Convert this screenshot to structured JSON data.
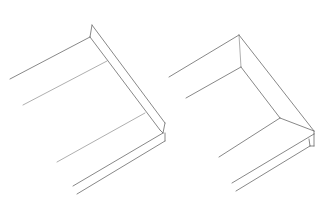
{
  "diagram": {
    "background": "#ffffff",
    "line_color": "#6a6a6a",
    "light_line_color": "#9a9a9a",
    "figures": [
      {
        "name": "left-trim-profile",
        "lines": [
          {
            "x1": 10,
            "y1": 79,
            "x2": 90,
            "y2": 37,
            "tone": "dark"
          },
          {
            "x1": 23,
            "y1": 105,
            "x2": 107,
            "y2": 61,
            "tone": "light"
          },
          {
            "x1": 90,
            "y1": 37,
            "x2": 92,
            "y2": 25,
            "tone": "dark"
          },
          {
            "x1": 92,
            "y1": 25,
            "x2": 165,
            "y2": 123,
            "tone": "dark"
          },
          {
            "x1": 90,
            "y1": 37,
            "x2": 160,
            "y2": 130,
            "tone": "dark"
          },
          {
            "x1": 57,
            "y1": 162,
            "x2": 145,
            "y2": 113,
            "tone": "light"
          },
          {
            "x1": 165,
            "y1": 123,
            "x2": 163,
            "y2": 133,
            "tone": "dark"
          },
          {
            "x1": 160,
            "y1": 130,
            "x2": 163,
            "y2": 133,
            "tone": "dark"
          },
          {
            "x1": 73,
            "y1": 186,
            "x2": 163,
            "y2": 133,
            "tone": "dark"
          },
          {
            "x1": 77,
            "y1": 194,
            "x2": 165,
            "y2": 141,
            "tone": "dark"
          },
          {
            "x1": 165,
            "y1": 133,
            "x2": 165,
            "y2": 141,
            "tone": "dark"
          }
        ]
      },
      {
        "name": "right-trim-profile",
        "lines": [
          {
            "x1": 169,
            "y1": 77,
            "x2": 239,
            "y2": 35,
            "tone": "dark"
          },
          {
            "x1": 186,
            "y1": 98,
            "x2": 241,
            "y2": 67,
            "tone": "dark"
          },
          {
            "x1": 239,
            "y1": 35,
            "x2": 241,
            "y2": 67,
            "tone": "light"
          },
          {
            "x1": 239,
            "y1": 35,
            "x2": 314,
            "y2": 131,
            "tone": "dark"
          },
          {
            "x1": 241,
            "y1": 67,
            "x2": 280,
            "y2": 118,
            "tone": "dark"
          },
          {
            "x1": 219,
            "y1": 157,
            "x2": 280,
            "y2": 118,
            "tone": "dark"
          },
          {
            "x1": 280,
            "y1": 118,
            "x2": 314,
            "y2": 131,
            "tone": "dark"
          },
          {
            "x1": 232,
            "y1": 183,
            "x2": 314,
            "y2": 134,
            "tone": "dark"
          },
          {
            "x1": 236,
            "y1": 191,
            "x2": 310,
            "y2": 146,
            "tone": "dark"
          },
          {
            "x1": 314,
            "y1": 131,
            "x2": 314,
            "y2": 134,
            "tone": "dark"
          },
          {
            "x1": 310,
            "y1": 146,
            "x2": 314,
            "y2": 146,
            "tone": "dark"
          },
          {
            "x1": 314,
            "y1": 134,
            "x2": 314,
            "y2": 146,
            "tone": "dark"
          },
          {
            "x1": 310,
            "y1": 146,
            "x2": 309,
            "y2": 139,
            "tone": "dark"
          }
        ]
      }
    ]
  }
}
